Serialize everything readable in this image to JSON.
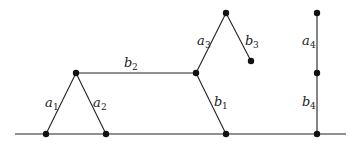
{
  "diagram": {
    "ground": {
      "x1": 15,
      "y": 134,
      "x2": 346
    },
    "nodes": [
      {
        "id": "g1",
        "x": 46,
        "y": 134
      },
      {
        "id": "g2",
        "x": 106,
        "y": 134
      },
      {
        "id": "g3",
        "x": 226,
        "y": 134
      },
      {
        "id": "g4",
        "x": 317,
        "y": 134
      },
      {
        "id": "p1",
        "x": 76,
        "y": 73
      },
      {
        "id": "p2",
        "x": 196,
        "y": 73
      },
      {
        "id": "p3",
        "x": 226,
        "y": 13
      },
      {
        "id": "p4",
        "x": 251,
        "y": 61
      },
      {
        "id": "p5",
        "x": 317,
        "y": 13
      },
      {
        "id": "p6",
        "x": 317,
        "y": 73
      }
    ],
    "edges": [
      {
        "from": "g1",
        "to": "p1",
        "label": "a",
        "sub": "1"
      },
      {
        "from": "p1",
        "to": "g2",
        "label": "a",
        "sub": "2"
      },
      {
        "from": "p1",
        "to": "p2",
        "label": "b",
        "sub": "2"
      },
      {
        "from": "p2",
        "to": "g3",
        "label": "b",
        "sub": "1"
      },
      {
        "from": "p2",
        "to": "p3",
        "label": "a",
        "sub": "3"
      },
      {
        "from": "p3",
        "to": "p4",
        "label": "b",
        "sub": "3"
      },
      {
        "from": "p5",
        "to": "p6",
        "label": "a",
        "sub": "4"
      },
      {
        "from": "p6",
        "to": "g4",
        "label": "b",
        "sub": "4"
      }
    ],
    "labels": {
      "a1": {
        "text": "a",
        "sub": "1"
      },
      "a2": {
        "text": "a",
        "sub": "2"
      },
      "a3": {
        "text": "a",
        "sub": "3"
      },
      "a4": {
        "text": "a",
        "sub": "4"
      },
      "b1": {
        "text": "b",
        "sub": "1"
      },
      "b2": {
        "text": "b",
        "sub": "2"
      },
      "b3": {
        "text": "b",
        "sub": "3"
      },
      "b4": {
        "text": "b",
        "sub": "4"
      }
    }
  }
}
